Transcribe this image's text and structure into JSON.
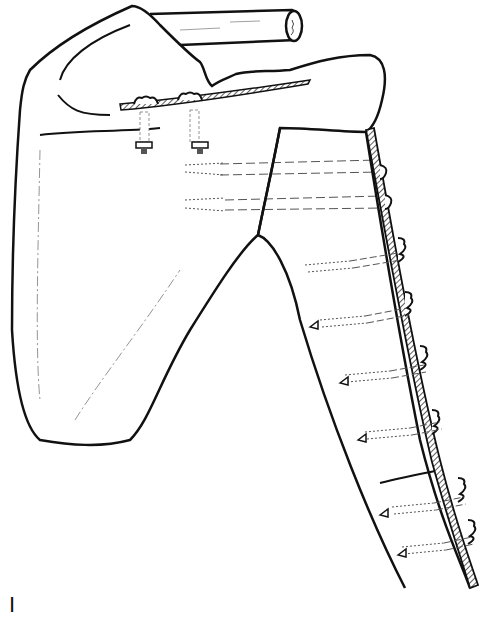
{
  "figure": {
    "panel_label": "I",
    "colors": {
      "line": "#111111",
      "background": "#ffffff",
      "hatch": "#333333",
      "dashed": "#555555"
    },
    "components": [
      "clavicle",
      "scapula",
      "acromion",
      "glenoid-humeral-junction",
      "humerus",
      "fixation-plate",
      "acromion-plate-segment",
      "screws"
    ],
    "screw_count_humerus": 6,
    "screw_count_acromion": 2,
    "glenoid_screw_count": 2
  }
}
